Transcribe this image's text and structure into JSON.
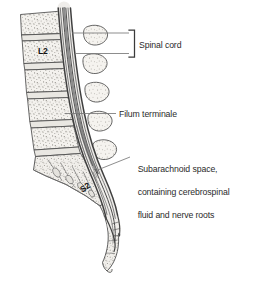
{
  "figure": {
    "background_color": "#ffffff",
    "ink_color": "#2b2b2b",
    "bone_fill": "#f2f0ec",
    "bone_outline": "#4a4a4a",
    "canal_dark": "#3a3a3a",
    "label_color": "#2b2b2b"
  },
  "labels": {
    "spinal_cord": "Spinal cord",
    "filum_terminale": "Filum terminale",
    "subarachnoid_line1": "Subarachnoid space,",
    "subarachnoid_line2": "containing cerebrospinal",
    "subarachnoid_line3": "fluid and nerve roots"
  },
  "vertebra_labels": {
    "l2": "L2",
    "s2": "S2"
  },
  "leaders": {
    "spinal_cord_bracket": "bracket-right",
    "filum_terminale_line": "straight-leader-line",
    "subarachnoid_line": "angled-leader-line"
  }
}
